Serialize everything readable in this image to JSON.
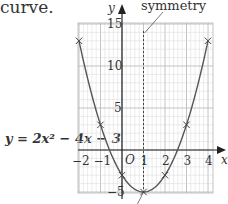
{
  "text": {
    "lead": "curve.",
    "equation": "y = 2x² − 4x − 3",
    "symmetry_label": "symmetry"
  },
  "axes": {
    "x_name": "x",
    "y_name": "y",
    "origin": "O",
    "x_ticks": [
      "−2",
      "−1",
      "1",
      "2",
      "3",
      "4"
    ],
    "y_ticks": [
      "15",
      "10",
      "5",
      "−5"
    ]
  },
  "colors": {
    "grid_minor": "#d9d9d9",
    "grid_major": "#b5b5b5",
    "curve": "#555555",
    "axis": "#222222",
    "text": "#333333"
  },
  "chart_data": {
    "type": "line",
    "title": "",
    "equation": "y = 2x^2 - 4x - 3",
    "xlabel": "x",
    "ylabel": "y",
    "x": [
      -2,
      -1,
      0,
      1,
      2,
      3,
      4
    ],
    "values": [
      13,
      3,
      -3,
      -5,
      -3,
      3,
      13
    ],
    "series": [
      {
        "name": "y = 2x^2 - 4x - 3",
        "x": [
          -2,
          -1,
          0,
          1,
          2,
          3,
          4
        ],
        "values": [
          13,
          3,
          -3,
          -5,
          -3,
          3,
          13
        ],
        "markers": "x"
      }
    ],
    "xlim": [
      -2,
      4
    ],
    "ylim": [
      -5,
      15
    ],
    "x_tick_labels": [
      "-2",
      "-1",
      "1",
      "2",
      "3",
      "4"
    ],
    "y_tick_labels": [
      "15",
      "10",
      "5",
      "-5"
    ],
    "grid": true,
    "annotations": [
      {
        "text": "symmetry",
        "note": "line of symmetry, dashed vertical at x = 1"
      },
      {
        "text": "O",
        "note": "origin"
      }
    ],
    "axis_of_symmetry": 1,
    "vertex": [
      1,
      -5
    ]
  }
}
